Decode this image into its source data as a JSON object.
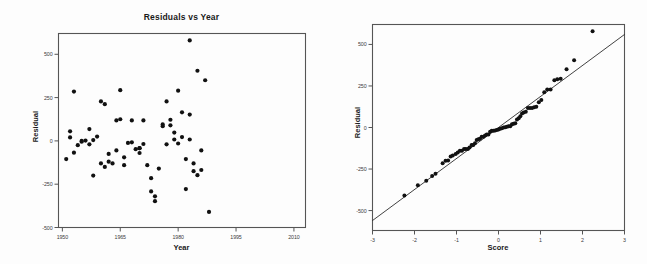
{
  "page": {
    "background": "#fdfdfd",
    "ink": "#111111",
    "frame_color": "#555555"
  },
  "chart_data": [
    {
      "id": "residuals-vs-year",
      "type": "scatter",
      "title": "Residuals vs Year",
      "xlabel": "Year",
      "ylabel": "Residual",
      "xlim": [
        1949,
        2013
      ],
      "ylim": [
        -500,
        620
      ],
      "grid": false,
      "legend": "none",
      "xticks": [
        1950,
        1965,
        1980,
        1995,
        2010
      ],
      "xticklabels": [
        "1950",
        "1965",
        "1980",
        "1995",
        "2010"
      ],
      "yticks": [
        500,
        250,
        0,
        -250,
        -500
      ],
      "yticklabels": [
        "500",
        "250",
        "0",
        "-250",
        "-500"
      ],
      "marker": "filled-circle",
      "marker_color": "#111111",
      "points": [
        {
          "x": 1951,
          "y": -105
        },
        {
          "x": 1952,
          "y": 20
        },
        {
          "x": 1952,
          "y": 55
        },
        {
          "x": 1953,
          "y": -68
        },
        {
          "x": 1953,
          "y": 285
        },
        {
          "x": 1954,
          "y": -25
        },
        {
          "x": 1955,
          "y": -5
        },
        {
          "x": 1955,
          "y": 0
        },
        {
          "x": 1956,
          "y": 2
        },
        {
          "x": 1957,
          "y": -20
        },
        {
          "x": 1957,
          "y": 68
        },
        {
          "x": 1958,
          "y": 5
        },
        {
          "x": 1958,
          "y": -200
        },
        {
          "x": 1959,
          "y": 25
        },
        {
          "x": 1960,
          "y": 228
        },
        {
          "x": 1960,
          "y": -130
        },
        {
          "x": 1961,
          "y": 212
        },
        {
          "x": 1961,
          "y": -150
        },
        {
          "x": 1962,
          "y": -75
        },
        {
          "x": 1962,
          "y": -120
        },
        {
          "x": 1963,
          "y": -130
        },
        {
          "x": 1964,
          "y": 118
        },
        {
          "x": 1964,
          "y": -55
        },
        {
          "x": 1965,
          "y": 293
        },
        {
          "x": 1965,
          "y": 125
        },
        {
          "x": 1966,
          "y": -95
        },
        {
          "x": 1966,
          "y": -140
        },
        {
          "x": 1967,
          "y": -12
        },
        {
          "x": 1968,
          "y": -8
        },
        {
          "x": 1968,
          "y": 118
        },
        {
          "x": 1969,
          "y": -48
        },
        {
          "x": 1970,
          "y": -42
        },
        {
          "x": 1970,
          "y": -42
        },
        {
          "x": 1970,
          "y": -70
        },
        {
          "x": 1971,
          "y": 118
        },
        {
          "x": 1971,
          "y": -18
        },
        {
          "x": 1972,
          "y": -140
        },
        {
          "x": 1973,
          "y": -215
        },
        {
          "x": 1973,
          "y": -292
        },
        {
          "x": 1974,
          "y": -320
        },
        {
          "x": 1974,
          "y": -348
        },
        {
          "x": 1975,
          "y": -160
        },
        {
          "x": 1976,
          "y": 95
        },
        {
          "x": 1976,
          "y": 85
        },
        {
          "x": 1977,
          "y": 228
        },
        {
          "x": 1977,
          "y": -20
        },
        {
          "x": 1978,
          "y": 90
        },
        {
          "x": 1978,
          "y": 122
        },
        {
          "x": 1979,
          "y": 48
        },
        {
          "x": 1979,
          "y": 8
        },
        {
          "x": 1980,
          "y": -15
        },
        {
          "x": 1980,
          "y": 290
        },
        {
          "x": 1981,
          "y": 22
        },
        {
          "x": 1981,
          "y": 165
        },
        {
          "x": 1982,
          "y": -105
        },
        {
          "x": 1982,
          "y": -278
        },
        {
          "x": 1983,
          "y": 8
        },
        {
          "x": 1983,
          "y": 152
        },
        {
          "x": 1983,
          "y": 580
        },
        {
          "x": 1984,
          "y": -130
        },
        {
          "x": 1984,
          "y": -175
        },
        {
          "x": 1985,
          "y": -198
        },
        {
          "x": 1985,
          "y": 405
        },
        {
          "x": 1986,
          "y": -168
        },
        {
          "x": 1986,
          "y": -55
        },
        {
          "x": 1987,
          "y": 350
        },
        {
          "x": 1988,
          "y": -410
        }
      ],
      "note": "x values are an illustrative reconstruction of the plotted point positions"
    },
    {
      "id": "normal-qq-residual",
      "type": "scatter",
      "title": "",
      "xlabel": "Score",
      "ylabel": "Residual",
      "xlim": [
        -3,
        3
      ],
      "ylim": [
        -620,
        620
      ],
      "grid": false,
      "legend": "none",
      "xticks": [
        -3,
        -2,
        -1,
        0,
        1,
        2,
        3
      ],
      "xticklabels": [
        "-3",
        "-2",
        "-1",
        "0",
        "1",
        "2",
        "3"
      ],
      "yticks": [
        500,
        250,
        0,
        -250,
        -500
      ],
      "yticklabels": [
        "500",
        "250",
        "0",
        "-250",
        "-500"
      ],
      "marker": "filled-circle",
      "marker_color": "#111111",
      "reference_line": {
        "type": "line",
        "x": [
          -3,
          3
        ],
        "y": [
          -560,
          560
        ],
        "color": "#111111"
      },
      "points": [
        {
          "x": -2.24,
          "y": -410
        },
        {
          "x": -1.92,
          "y": -348
        },
        {
          "x": -1.72,
          "y": -320
        },
        {
          "x": -1.58,
          "y": -292
        },
        {
          "x": -1.5,
          "y": -278
        },
        {
          "x": -1.33,
          "y": -215
        },
        {
          "x": -1.26,
          "y": -200
        },
        {
          "x": -1.2,
          "y": -198
        },
        {
          "x": -1.14,
          "y": -175
        },
        {
          "x": -1.09,
          "y": -168
        },
        {
          "x": -1.02,
          "y": -160
        },
        {
          "x": -0.97,
          "y": -150
        },
        {
          "x": -0.92,
          "y": -140
        },
        {
          "x": -0.87,
          "y": -140
        },
        {
          "x": -0.82,
          "y": -130
        },
        {
          "x": -0.78,
          "y": -130
        },
        {
          "x": -0.73,
          "y": -130
        },
        {
          "x": -0.69,
          "y": -120
        },
        {
          "x": -0.64,
          "y": -105
        },
        {
          "x": -0.6,
          "y": -105
        },
        {
          "x": -0.56,
          "y": -95
        },
        {
          "x": -0.52,
          "y": -75
        },
        {
          "x": -0.48,
          "y": -70
        },
        {
          "x": -0.44,
          "y": -68
        },
        {
          "x": -0.4,
          "y": -55
        },
        {
          "x": -0.36,
          "y": -55
        },
        {
          "x": -0.32,
          "y": -48
        },
        {
          "x": -0.28,
          "y": -42
        },
        {
          "x": -0.24,
          "y": -42
        },
        {
          "x": -0.2,
          "y": -25
        },
        {
          "x": -0.16,
          "y": -20
        },
        {
          "x": -0.12,
          "y": -20
        },
        {
          "x": -0.08,
          "y": -18
        },
        {
          "x": -0.04,
          "y": -15
        },
        {
          "x": 0.0,
          "y": -12
        },
        {
          "x": 0.04,
          "y": -8
        },
        {
          "x": 0.08,
          "y": -5
        },
        {
          "x": 0.12,
          "y": 0
        },
        {
          "x": 0.16,
          "y": 2
        },
        {
          "x": 0.2,
          "y": 5
        },
        {
          "x": 0.24,
          "y": 8
        },
        {
          "x": 0.28,
          "y": 8
        },
        {
          "x": 0.32,
          "y": 20
        },
        {
          "x": 0.36,
          "y": 22
        },
        {
          "x": 0.4,
          "y": 25
        },
        {
          "x": 0.44,
          "y": 48
        },
        {
          "x": 0.48,
          "y": 55
        },
        {
          "x": 0.52,
          "y": 68
        },
        {
          "x": 0.56,
          "y": 85
        },
        {
          "x": 0.6,
          "y": 90
        },
        {
          "x": 0.65,
          "y": 95
        },
        {
          "x": 0.7,
          "y": 118
        },
        {
          "x": 0.75,
          "y": 118
        },
        {
          "x": 0.8,
          "y": 118
        },
        {
          "x": 0.85,
          "y": 122
        },
        {
          "x": 0.9,
          "y": 125
        },
        {
          "x": 0.96,
          "y": 152
        },
        {
          "x": 1.02,
          "y": 165
        },
        {
          "x": 1.09,
          "y": 212
        },
        {
          "x": 1.16,
          "y": 228
        },
        {
          "x": 1.24,
          "y": 228
        },
        {
          "x": 1.33,
          "y": 285
        },
        {
          "x": 1.4,
          "y": 290
        },
        {
          "x": 1.48,
          "y": 293
        },
        {
          "x": 1.62,
          "y": 350
        },
        {
          "x": 1.8,
          "y": 405
        },
        {
          "x": 2.24,
          "y": 580
        }
      ]
    }
  ]
}
